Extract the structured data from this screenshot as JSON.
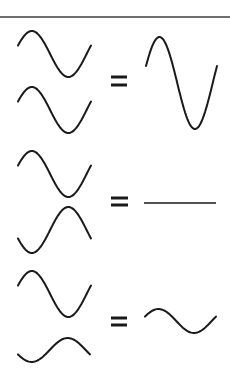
{
  "colors": {
    "stroke": "#1a1a1a",
    "divider": "#6f6f6f",
    "background": "#ffffff"
  },
  "divider": {
    "y": 17,
    "x1": 0,
    "x2": 230
  },
  "equations": [
    {
      "name": "constructive-interference",
      "wave_a": {
        "x0": 18,
        "x1": 91,
        "mid": 54,
        "amp": 23,
        "phase": "up"
      },
      "wave_b": {
        "x0": 18,
        "x1": 91,
        "mid": 110,
        "amp": 23,
        "phase": "up"
      },
      "equals": {
        "x0": 111,
        "x1": 127,
        "y1": 77,
        "y2": 85
      },
      "result": {
        "type": "wave",
        "x0": 146,
        "x1": 217,
        "mid": 83,
        "amp": 46,
        "phase": "up"
      }
    },
    {
      "name": "destructive-interference",
      "wave_a": {
        "x0": 18,
        "x1": 91,
        "mid": 174,
        "amp": 23,
        "phase": "up"
      },
      "wave_b": {
        "x0": 18,
        "x1": 91,
        "mid": 230,
        "amp": 23,
        "phase": "down"
      },
      "equals": {
        "x0": 111,
        "x1": 128,
        "y1": 198,
        "y2": 205
      },
      "result": {
        "type": "flat",
        "x0": 144,
        "x1": 216,
        "mid": 203,
        "amp": 0,
        "phase": "none"
      }
    },
    {
      "name": "partial-interference",
      "wave_a": {
        "x0": 18,
        "x1": 91,
        "mid": 294,
        "amp": 23,
        "phase": "up"
      },
      "wave_b": {
        "x0": 18,
        "x1": 90,
        "mid": 350,
        "amp": 12,
        "phase": "down"
      },
      "equals": {
        "x0": 111,
        "x1": 127,
        "y1": 318,
        "y2": 325
      },
      "result": {
        "type": "wave",
        "x0": 145,
        "x1": 216,
        "mid": 321,
        "amp": 12,
        "phase": "up"
      }
    }
  ]
}
